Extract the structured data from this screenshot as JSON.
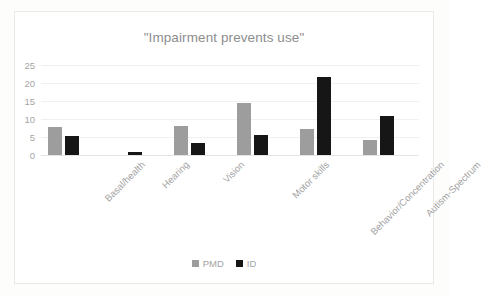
{
  "chart_data": {
    "type": "bar",
    "title": "\"Impairment prevents use\"",
    "xlabel": "",
    "ylabel": "",
    "ylim": [
      0,
      25
    ],
    "yticks": [
      0,
      5,
      10,
      15,
      20,
      25
    ],
    "grid": true,
    "legend_position": "bottom",
    "categories": [
      "Basal/health",
      "Hearing",
      "Vision",
      "Motor skills",
      "Behavior/Concentration",
      "Autism-Spectrum"
    ],
    "series": [
      {
        "name": "PMD",
        "color": "#9d9d9d",
        "values": [
          7.9,
          0,
          8.1,
          14.4,
          7.3,
          4.1
        ]
      },
      {
        "name": "ID",
        "color": "#161616",
        "values": [
          5.4,
          0.8,
          3.3,
          5.6,
          21.7,
          10.7
        ]
      }
    ]
  },
  "colors": {
    "page_background": "#fdfdfc",
    "card_background": "#ffffff",
    "card_border": "#e9e9e7",
    "title_text": "#8d8d8d",
    "tick_text": "#a3a3a3",
    "gridline": "#f0f0ee",
    "axis_line": "#e4e4e2"
  }
}
